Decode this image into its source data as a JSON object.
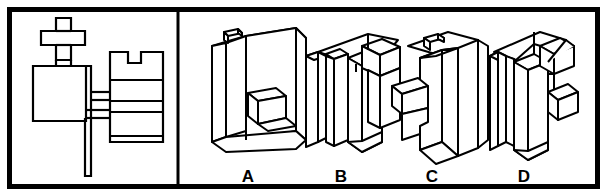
{
  "figure": {
    "stroke_color": "#000000",
    "fill_color": "#ffffff",
    "border_color": "#000000",
    "border_width_px": 5,
    "divider_x": 178
  },
  "left_panel": {
    "name": "orthographic-views",
    "views": [
      {
        "id": "top-view",
        "shape": "plus-cross",
        "outline": "M 56,18 L 71,18 L 71,31 L 85,31 L 85,45 L 71,45 L 71,59 L 56,59 L 56,45 L 41,45 L 41,31 L 56,31 Z"
      },
      {
        "id": "front-view",
        "shape": "rectangle-with-tab",
        "outline": "M 33,65 L 86,65 L 86,121 L 33,121 Z"
      },
      {
        "id": "side-view",
        "shape": "notched-rectangle-with-steps",
        "outline": "M 110,52 L 163,52 L 163,142 L 110,142 Z",
        "notch": "M 128,52 L 128,63 L 140,63 L 140,52",
        "step_lines_y": [
          80,
          101,
          112,
          136
        ]
      },
      {
        "id": "projection-tail",
        "shape": "vertical-bar",
        "outline": "M 84,118 L 90,118 L 90,176 L 84,176 Z"
      }
    ]
  },
  "right_panel": {
    "name": "answer-options",
    "options": [
      {
        "id": "option-a",
        "label": "A",
        "label_x": 248,
        "label_y": 176
      },
      {
        "id": "option-b",
        "label": "B",
        "label_x": 341,
        "label_y": 176
      },
      {
        "id": "option-c",
        "label": "C",
        "label_x": 432,
        "label_y": 176
      },
      {
        "id": "option-d",
        "label": "D",
        "label_x": 524,
        "label_y": 176
      }
    ]
  }
}
